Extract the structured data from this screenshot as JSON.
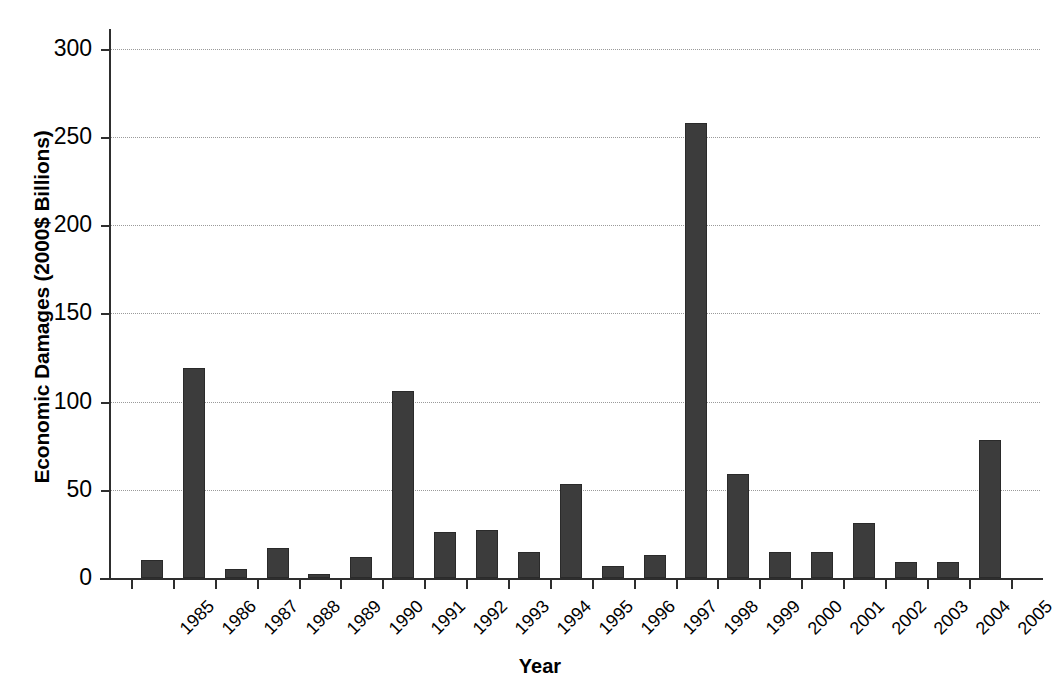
{
  "chart_data": {
    "type": "bar",
    "title": "",
    "xlabel": "Year",
    "ylabel": "Economic Damages (2000$ Billions)",
    "categories": [
      "1985",
      "1986",
      "1987",
      "1988",
      "1989",
      "1990",
      "1991",
      "1992",
      "1993",
      "1994",
      "1995",
      "1996",
      "1997",
      "1998",
      "1999",
      "2000",
      "2001",
      "2002",
      "2003",
      "2004",
      "2005"
    ],
    "values": [
      10,
      119,
      5,
      17,
      2,
      12,
      106,
      26,
      27,
      15,
      53,
      7,
      13,
      258,
      59,
      15,
      15,
      31,
      9,
      9,
      78
    ],
    "ylim": [
      0,
      310
    ],
    "yticks": [
      0,
      50,
      100,
      150,
      200,
      250,
      300
    ],
    "ytick_labels": [
      "0",
      "50",
      "100",
      "150",
      "200",
      "250",
      "300"
    ],
    "grid": true,
    "legend": false,
    "bar_color": "#3c3c3c",
    "background_color": "#ffffff",
    "gridline_color": "#9a9a9a",
    "axis_color": "#2e2e2e"
  }
}
